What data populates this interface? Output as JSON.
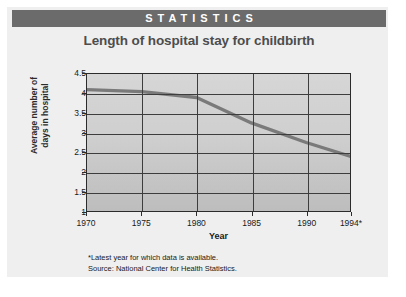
{
  "banner": {
    "label": "STATISTICS",
    "background_color": "#6b6b6b",
    "text_color": "#ffffff"
  },
  "card": {
    "background_color": "#efefef"
  },
  "footnotes": [
    "*Latest year for which data is available.",
    "Source: National Center for Health Statistics."
  ],
  "chart_data": {
    "type": "line",
    "title": "Length of hospital stay for childbirth",
    "xlabel": "Year",
    "ylabel": "Average number of days in hospital",
    "ylabel_lines": [
      "Average number of",
      "days in hospital"
    ],
    "x": [
      1970,
      1975,
      1980,
      1985,
      1990,
      1994
    ],
    "values": [
      4.1,
      4.05,
      3.9,
      3.25,
      2.75,
      2.4
    ],
    "xtick_labels": [
      "1970",
      "1975",
      "1980",
      "1985",
      "1990",
      "1994*"
    ],
    "ytick_labels": [
      "4.5",
      "4",
      "3.5",
      "3",
      "2.5",
      "2",
      "1.5",
      "1"
    ],
    "ytick_values": [
      4.5,
      4,
      3.5,
      3,
      2.5,
      2,
      1.5,
      1
    ],
    "xlim": [
      1970,
      1994
    ],
    "ylim": [
      1,
      4.5
    ],
    "grid": true,
    "legend": "none",
    "series_color": "#7a7a7a",
    "plot_background": "#cfcfcf",
    "grid_color": "#3d3d3d"
  }
}
